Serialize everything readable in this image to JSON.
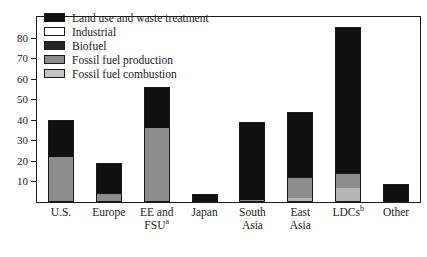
{
  "chart_data": {
    "type": "bar",
    "stacked": true,
    "title": "",
    "xlabel": "",
    "ylabel": "",
    "ylim": [
      0,
      90
    ],
    "yticks": [
      10,
      20,
      30,
      40,
      50,
      60,
      70,
      80
    ],
    "ytick_labels": [
      "10",
      "20",
      "30",
      "40",
      "50",
      "60",
      "70",
      "80"
    ],
    "grid": false,
    "legend_position": "upper-left-inside",
    "categories": [
      "U.S.",
      "Europe",
      "EE and FSUᵃ",
      "Japan",
      "South Asia",
      "East Asia",
      "LDCsᵇ",
      "Other"
    ],
    "category_labels": [
      {
        "line1": "U.S.",
        "line2": "",
        "sup": ""
      },
      {
        "line1": "Europe",
        "line2": "",
        "sup": ""
      },
      {
        "line1": "EE and",
        "line2": "FSU",
        "sup": "a"
      },
      {
        "line1": "Japan",
        "line2": "",
        "sup": ""
      },
      {
        "line1": "South",
        "line2": "Asia",
        "sup": ""
      },
      {
        "line1": "East",
        "line2": "Asia",
        "sup": ""
      },
      {
        "line1": "LDCs",
        "line2": "",
        "sup": "b"
      },
      {
        "line1": "Other",
        "line2": "",
        "sup": ""
      }
    ],
    "series": [
      {
        "name": "Fossil fuel combustion",
        "color": "#b5b5b5",
        "values": [
          0,
          0,
          0,
          0,
          0,
          2,
          7,
          0
        ]
      },
      {
        "name": "Fossil fuel production",
        "color": "#8c8c8c",
        "values": [
          22,
          4,
          36,
          0,
          1,
          10,
          7,
          0
        ]
      },
      {
        "name": "Biofuel",
        "color": "#262626",
        "values": [
          0,
          0,
          0,
          0,
          0,
          0,
          0,
          0
        ]
      },
      {
        "name": "Industrial",
        "color": "#ffffff",
        "values": [
          0,
          0,
          0,
          0,
          0,
          0,
          0,
          0
        ]
      },
      {
        "name": "Land use and waste treatment",
        "color": "#111111",
        "values": [
          18,
          15,
          20,
          4,
          38,
          32,
          71,
          9
        ]
      }
    ],
    "totals": [
      40,
      19,
      56,
      4,
      39,
      44,
      85,
      9
    ],
    "legend": [
      {
        "label": "Land use and waste treatment",
        "color": "#111111"
      },
      {
        "label": "Industrial",
        "color": "#ffffff"
      },
      {
        "label": "Biofuel",
        "color": "#262626"
      },
      {
        "label": "Fossil fuel production",
        "color": "#8c8c8c"
      },
      {
        "label": "Fossil fuel combustion",
        "color": "#c4c4c4"
      }
    ]
  }
}
